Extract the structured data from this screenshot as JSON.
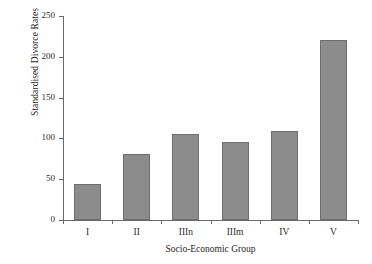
{
  "chart_data": {
    "type": "bar",
    "title": "",
    "categories": [
      "I",
      "II",
      "IIIn",
      "IIIm",
      "IV",
      "V"
    ],
    "values": [
      44,
      81,
      106,
      96,
      109,
      220
    ],
    "xlabel": "Socio-Economic Group",
    "ylabel": "Standardised Divorce Rates",
    "ylim": [
      0,
      250
    ],
    "yticks": [
      0,
      50,
      100,
      150,
      200,
      250
    ],
    "ytick_labels": [
      "0",
      "50",
      "100",
      "150",
      "200",
      "250"
    ],
    "grid": false,
    "legend": null,
    "legend_position": "none",
    "bar_color": "#8c8c8c",
    "bar_edge_color": "#6e6e6e",
    "axis_color": "#6a6a6a",
    "background_color": "#ffffff",
    "text_color": "#2a2a2a"
  }
}
